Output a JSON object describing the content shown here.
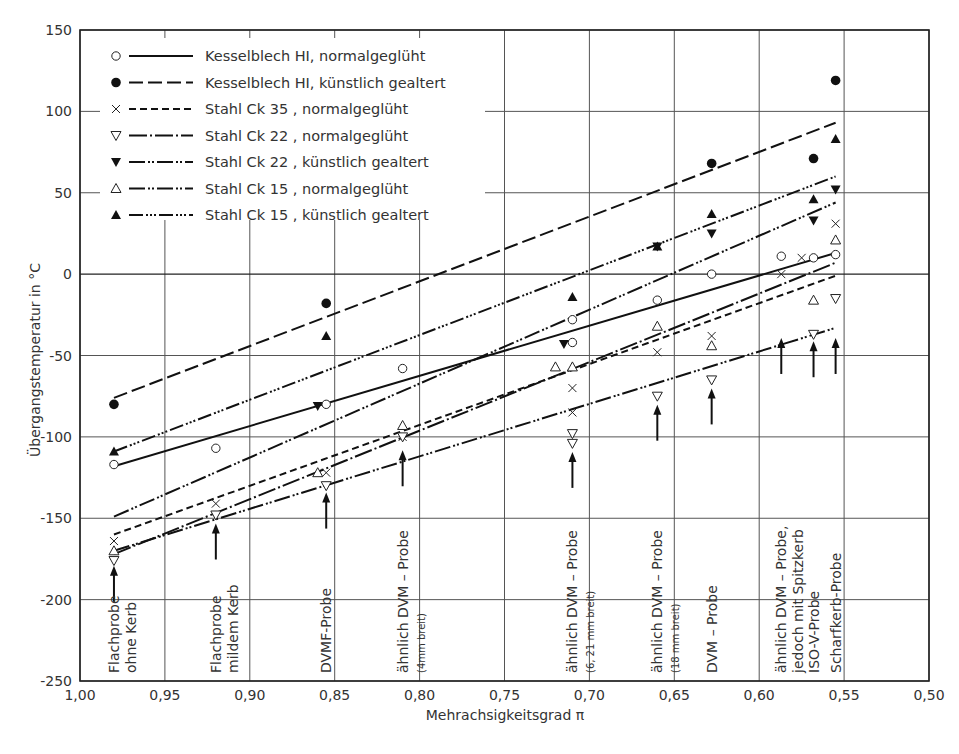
{
  "chart_data": {
    "type": "scatter",
    "title": "",
    "xlabel": "Mehrachsigkeitsgrad π",
    "ylabel": "Übergangstemperatur in °C",
    "xlim": [
      1.0,
      0.5
    ],
    "x_reversed": true,
    "ylim": [
      -250,
      150
    ],
    "grid": true,
    "legend_position": "upper-left",
    "x_ticks": [
      "1,00",
      "0,95",
      "0,90",
      "0,85",
      "0,80",
      "0,75",
      "0,70",
      "0,65",
      "0,60",
      "0,55",
      "0,50"
    ],
    "y_ticks": [
      "150",
      "100",
      "50",
      "0",
      "-50",
      "-100",
      "-150",
      "-200",
      "-250"
    ],
    "series": [
      {
        "name": "Kesselblech HI, normalgeglüht",
        "marker": "open-circle",
        "line_style": "solid",
        "points": [
          [
            0.98,
            -117
          ],
          [
            0.92,
            -107
          ],
          [
            0.855,
            -80
          ],
          [
            0.81,
            -58
          ],
          [
            0.71,
            -28
          ],
          [
            0.71,
            -42
          ],
          [
            0.66,
            -16
          ],
          [
            0.628,
            0
          ],
          [
            0.587,
            11
          ],
          [
            0.568,
            10
          ],
          [
            0.555,
            12
          ]
        ],
        "fit_line": [
          [
            0.98,
            -118
          ],
          [
            0.555,
            13
          ]
        ]
      },
      {
        "name": "Kesselblech HI, künstlich gealtert",
        "marker": "filled-circle",
        "line_style": "long-dash",
        "points": [
          [
            0.98,
            -80
          ],
          [
            0.855,
            -18
          ],
          [
            0.628,
            68
          ],
          [
            0.568,
            71
          ],
          [
            0.555,
            119
          ]
        ],
        "fit_line": [
          [
            0.98,
            -76
          ],
          [
            0.555,
            93
          ]
        ]
      },
      {
        "name": "Stahl Ck 35 , normalgeglüht",
        "marker": "cross",
        "line_style": "dashed",
        "points": [
          [
            0.98,
            -164
          ],
          [
            0.92,
            -141
          ],
          [
            0.855,
            -122
          ],
          [
            0.81,
            -100
          ],
          [
            0.71,
            -70
          ],
          [
            0.71,
            -85
          ],
          [
            0.66,
            -48
          ],
          [
            0.628,
            -38
          ],
          [
            0.587,
            0
          ],
          [
            0.575,
            10
          ],
          [
            0.555,
            31
          ]
        ],
        "fit_line": [
          [
            0.98,
            -160
          ],
          [
            0.555,
            -1
          ]
        ]
      },
      {
        "name": "Stahl Ck 22 , normalgeglüht",
        "marker": "open-triangle-down",
        "line_style": "dash-dot",
        "points": [
          [
            0.98,
            -176
          ],
          [
            0.92,
            -148
          ],
          [
            0.855,
            -130
          ],
          [
            0.81,
            -100
          ],
          [
            0.71,
            -98
          ],
          [
            0.71,
            -104
          ],
          [
            0.66,
            -75
          ],
          [
            0.628,
            -65
          ],
          [
            0.568,
            -37
          ],
          [
            0.555,
            -15
          ]
        ],
        "fit_line": [
          [
            0.98,
            -172
          ],
          [
            0.555,
            7
          ]
        ]
      },
      {
        "name": "Stahl Ck 22 , künstlich gealtert",
        "marker": "filled-triangle-down",
        "line_style": "dash-dot-dot",
        "points": [
          [
            0.86,
            -81
          ],
          [
            0.715,
            -43
          ],
          [
            0.66,
            17
          ],
          [
            0.628,
            25
          ],
          [
            0.568,
            33
          ],
          [
            0.555,
            52
          ]
        ],
        "fit_line": [
          [
            0.98,
            -149
          ],
          [
            0.555,
            44
          ]
        ]
      },
      {
        "name": "Stahl Ck 15 , normalgeglüht",
        "marker": "open-triangle-up",
        "line_style": "dash-dot-dot-long",
        "points": [
          [
            0.98,
            -170
          ],
          [
            0.86,
            -122
          ],
          [
            0.81,
            -93
          ],
          [
            0.72,
            -57
          ],
          [
            0.71,
            -57
          ],
          [
            0.66,
            -32
          ],
          [
            0.628,
            -44
          ],
          [
            0.568,
            -16
          ],
          [
            0.555,
            21
          ]
        ],
        "fit_line": [
          [
            0.98,
            -170
          ],
          [
            0.555,
            -33
          ]
        ]
      },
      {
        "name": "Stahl Ck 15 , künstlich gealtert",
        "marker": "filled-triangle-up",
        "line_style": "dash-dot-dot-dot",
        "points": [
          [
            0.98,
            -109
          ],
          [
            0.855,
            -38
          ],
          [
            0.71,
            -14
          ],
          [
            0.66,
            17
          ],
          [
            0.628,
            37
          ],
          [
            0.568,
            46
          ],
          [
            0.555,
            83
          ]
        ],
        "fit_line": [
          [
            0.98,
            -109
          ],
          [
            0.555,
            60
          ]
        ]
      }
    ],
    "annotations": [
      {
        "x": 0.98,
        "lines": [
          "Flachprobe",
          "ohne Kerb"
        ]
      },
      {
        "x": 0.92,
        "lines": [
          "Flachprobe",
          "mildem Kerb"
        ]
      },
      {
        "x": 0.855,
        "lines": [
          "DVMF-Probe"
        ]
      },
      {
        "x": 0.81,
        "lines": [
          "ähnlich DVM – Probe",
          "(4mm breit)"
        ]
      },
      {
        "x": 0.71,
        "lines": [
          "ähnlich DVM – Probe",
          "(6, 21 mm breit)"
        ]
      },
      {
        "x": 0.66,
        "lines": [
          "ähnlich DVM – Probe",
          "(18 mm breit)"
        ]
      },
      {
        "x": 0.628,
        "lines": [
          "DVM – Probe"
        ]
      },
      {
        "x": 0.587,
        "lines": [
          "ähnlich DVM – Probe,",
          "jedoch mit Spitzkerb"
        ]
      },
      {
        "x": 0.568,
        "lines": [
          "ISO-V-Probe"
        ]
      },
      {
        "x": 0.555,
        "lines": [
          "Scharfkerb-Probe"
        ]
      }
    ]
  },
  "legend": {
    "items": [
      {
        "label": "Kesselblech HI, normalgeglüht",
        "marker": "open-circle",
        "dash": ""
      },
      {
        "label": "Kesselblech HI, künstlich gealtert",
        "marker": "filled-circle",
        "dash": "14,5"
      },
      {
        "label": "Stahl Ck 35 , normalgeglüht",
        "marker": "cross",
        "dash": "7,4"
      },
      {
        "label": "Stahl Ck 22 , normalgeglüht",
        "marker": "open-triangle-down",
        "dash": "18,3,2,3"
      },
      {
        "label": "Stahl Ck 22 , künstlich gealtert",
        "marker": "filled-triangle-down",
        "dash": "16,3,2,2,2,3"
      },
      {
        "label": "Stahl Ck 15 , normalgeglüht",
        "marker": "open-triangle-up",
        "dash": "16,3,2,2,2,3"
      },
      {
        "label": "Stahl Ck 15 , künstlich gealtert",
        "marker": "filled-triangle-up",
        "dash": "14,3,2,2,2,2,2,3"
      }
    ]
  },
  "axes": {
    "xlabel": "Mehrachsigkeitsgrad π",
    "ylabel": "Übergangstemperatur in °C"
  }
}
